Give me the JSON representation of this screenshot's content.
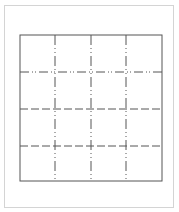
{
  "diagram": {
    "type": "grid",
    "rows": 4,
    "columns": 4,
    "colors": {
      "page_border": "#d4d4d4",
      "grid_line": "#555555"
    },
    "outer_frame": {
      "x": 20,
      "y": 35,
      "width": 142,
      "height": 146,
      "style": "solid"
    },
    "vertical_lines": [
      {
        "x": 55,
        "style": "dash-dot"
      },
      {
        "x": 91,
        "style": "dash-dot"
      },
      {
        "x": 126,
        "style": "dash-dot"
      }
    ],
    "horizontal_lines": [
      {
        "y": 72,
        "style": "dash-dot-dot"
      },
      {
        "y": 109,
        "style": "dashed"
      },
      {
        "y": 146,
        "style": "dashed"
      }
    ]
  }
}
